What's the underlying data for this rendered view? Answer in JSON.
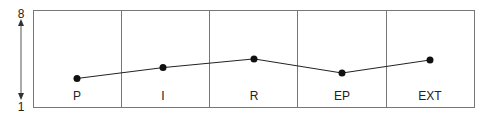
{
  "chart_data": {
    "type": "line",
    "title": "",
    "xlabel": "",
    "ylabel": "",
    "categories": [
      "P",
      "I",
      "R",
      "EP",
      "EXT"
    ],
    "values": [
      2.8,
      3.8,
      4.6,
      3.3,
      4.5
    ],
    "ylim": [
      1,
      8
    ],
    "y_axis_labels": {
      "top": "8",
      "bottom": "1"
    },
    "grid": "vertical column dividers",
    "legend": null,
    "colors": {
      "line": "#222222",
      "marker": "#111111",
      "frame": "#777777"
    }
  }
}
